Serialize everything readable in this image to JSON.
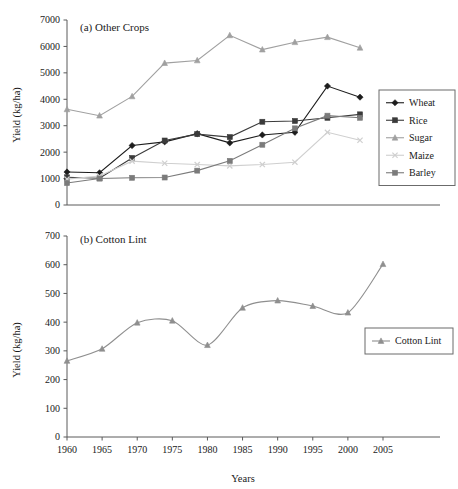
{
  "figure": {
    "panels": [
      {
        "id": "other-crops",
        "title": "(a) Other Crops",
        "ylabel": "Yield (kg/ha)",
        "xlabel": ""
      },
      {
        "id": "cotton-lint",
        "title": "(b) Cotton Lint",
        "ylabel": "Yield (kg/ha)",
        "xlabel": "Years"
      }
    ]
  },
  "chart_data": [
    {
      "type": "line",
      "title": "(a) Other Crops",
      "xlabel": "",
      "ylabel": "Yield (kg/ha)",
      "x": [
        1960,
        1965,
        1970,
        1975,
        1980,
        1985,
        1990,
        1995,
        2000,
        2005
      ],
      "xticklabels": [
        "1960",
        "1965",
        "1970",
        "1975",
        "1980",
        "1985",
        "1990",
        "1995",
        "2000",
        "2005"
      ],
      "yticklabels": [
        "0",
        "1000",
        "2000",
        "3000",
        "4000",
        "5000",
        "6000",
        "7000"
      ],
      "xlim": [
        1960,
        2005
      ],
      "ylim": [
        0,
        7000
      ],
      "ytick_step": 1000,
      "grid": false,
      "legend_position": "right",
      "series": [
        {
          "name": "Wheat",
          "marker": "diamond",
          "color": "#1c1c1c",
          "values": [
            1250,
            1220,
            2250,
            2390,
            2700,
            2350,
            2650,
            2750,
            4500,
            4080
          ]
        },
        {
          "name": "Rice",
          "marker": "square",
          "color": "#3b3b3b",
          "values": [
            1050,
            1010,
            1780,
            2440,
            2680,
            2570,
            3150,
            3180,
            3300,
            3430
          ]
        },
        {
          "name": "Sugar",
          "marker": "triangle",
          "color": "#a0a0a0",
          "values": [
            3620,
            3380,
            4110,
            5370,
            5470,
            6420,
            5880,
            6160,
            6350,
            5950
          ]
        },
        {
          "name": "Maize",
          "marker": "cross",
          "color": "#cfcfcf",
          "values": [
            980,
            1100,
            1660,
            1580,
            1530,
            1480,
            1530,
            1620,
            2750,
            2450
          ]
        },
        {
          "name": "Barley",
          "marker": "square",
          "color": "#7b7b7b",
          "values": [
            830,
            1000,
            1030,
            1040,
            1300,
            1670,
            2280,
            2900,
            3380,
            3300
          ]
        }
      ]
    },
    {
      "type": "line",
      "title": "(b) Cotton Lint",
      "xlabel": "Years",
      "ylabel": "Yield (kg/ha)",
      "x": [
        1960,
        1965,
        1970,
        1975,
        1980,
        1985,
        1990,
        1995,
        2000,
        2005
      ],
      "xticklabels": [
        "1960",
        "1965",
        "1970",
        "1975",
        "1980",
        "1985",
        "1990",
        "1995",
        "2000",
        "2005"
      ],
      "yticklabels": [
        "0",
        "100",
        "200",
        "300",
        "400",
        "500",
        "600",
        "700"
      ],
      "xlim": [
        1960,
        2005
      ],
      "ylim": [
        0,
        700
      ],
      "ytick_step": 100,
      "grid": false,
      "legend_position": "right",
      "series": [
        {
          "name": "Cotton Lint",
          "marker": "triangle",
          "color": "#8f8f8f",
          "values": [
            265,
            307,
            398,
            405,
            320,
            450,
            475,
            456,
            433,
            602
          ]
        }
      ]
    }
  ],
  "colors": {
    "axis": "#5a5a5a",
    "text": "#1a1a1a",
    "background": "#ffffff",
    "legend_border": "#6b6b6b"
  }
}
